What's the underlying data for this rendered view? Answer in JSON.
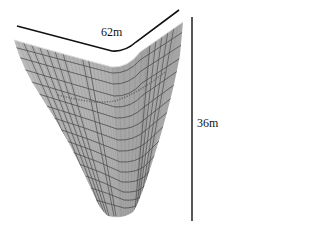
{
  "diagram": {
    "dimensions": {
      "width_label": "62m",
      "height_label": "36m"
    },
    "colors": {
      "surface_fill": "#b4b4b4",
      "surface_shade": "#9c9c9c",
      "mesh_line": "#4a4a4a",
      "dimension_line": "#111111",
      "background": "#ffffff"
    }
  }
}
